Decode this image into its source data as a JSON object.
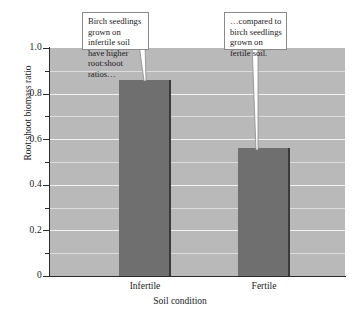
{
  "chart_data": {
    "type": "bar",
    "title": "",
    "categories": [
      "Infertile",
      "Fertile"
    ],
    "values": [
      0.86,
      0.56
    ],
    "series": [
      {
        "name": "Root:shoot biomass ratio",
        "values": [
          0.86,
          0.56
        ]
      }
    ],
    "xlabel": "Soil condition",
    "ylabel": "Root:shoot biomass ratio",
    "ylim": [
      0,
      1.0
    ],
    "ytick_labels": [
      "0",
      "0.2",
      "0.4",
      "0.6",
      "0.8",
      "1.0"
    ],
    "ytick_values": [
      0,
      0.2,
      0.4,
      0.6,
      0.8,
      1.0
    ],
    "yminor_tick_values": [
      0.1,
      0.3,
      0.5,
      0.7,
      0.9
    ],
    "grid": true,
    "grid_axis": "y",
    "legend": "none",
    "bar_color": "#6f6f6f",
    "plot_background": "#b9b9b9",
    "gridline_color": "#f1f1f1",
    "axis_color": "#2b2b2b",
    "annotations": [
      {
        "id": "callout-infertile",
        "text": "Birch seedlings grown on infertile soil have higher root:shoot ratios…",
        "points_to_category": "Infertile"
      },
      {
        "id": "callout-fertile",
        "text": "…compared to birch seedlings grown on fertile soil.",
        "points_to_category": "Fertile"
      }
    ]
  },
  "figure": {
    "caption_fragment": ""
  }
}
